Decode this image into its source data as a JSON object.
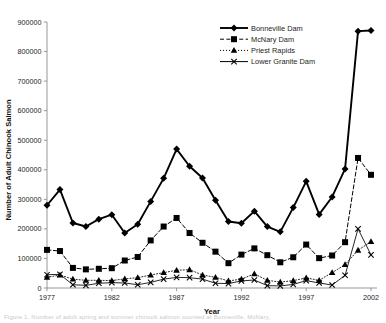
{
  "chart_data": {
    "type": "line",
    "title": "",
    "xlabel": "Year",
    "ylabel": "Number of Adult Chinook Salmon",
    "xlim": [
      1977,
      2002
    ],
    "ylim": [
      0,
      900000
    ],
    "xticks": [
      1977,
      1982,
      1987,
      1992,
      1997,
      2002
    ],
    "yticks": [
      0,
      100000,
      200000,
      300000,
      400000,
      500000,
      600000,
      700000,
      800000,
      900000
    ],
    "ytick_labels": [
      "0",
      "100000",
      "200000",
      "300000",
      "400000",
      "500000",
      "600000",
      "700000",
      "800000",
      "900000"
    ],
    "xtick_labels": [
      "1977",
      "1982",
      "1987",
      "1992",
      "1997",
      "2002"
    ],
    "grid": false,
    "legend_position": "top-right",
    "x": [
      1977,
      1978,
      1979,
      1980,
      1981,
      1982,
      1983,
      1984,
      1985,
      1986,
      1987,
      1988,
      1989,
      1990,
      1991,
      1992,
      1993,
      1994,
      1995,
      1996,
      1997,
      1998,
      1999,
      2000,
      2001,
      2002
    ],
    "series": [
      {
        "name": "Bonneville Dam",
        "marker": "diamond",
        "line": "solid",
        "color": "#000000",
        "values": [
          280000,
          333000,
          220000,
          208000,
          233000,
          248000,
          186000,
          216000,
          293000,
          371000,
          470000,
          412000,
          372000,
          297000,
          225000,
          219000,
          260000,
          208000,
          190000,
          272000,
          361000,
          249000,
          308000,
          403000,
          869000,
          871000
        ]
      },
      {
        "name": "McNary Dam",
        "marker": "square",
        "line": "dashed",
        "color": "#000000",
        "values": [
          129000,
          125000,
          68000,
          63000,
          65000,
          67000,
          93000,
          105000,
          161000,
          208000,
          237000,
          186000,
          153000,
          123000,
          84000,
          113000,
          134000,
          111000,
          87000,
          104000,
          147000,
          101000,
          110000,
          155000,
          440000,
          383000
        ]
      },
      {
        "name": "Priest Rapids",
        "marker": "triangle",
        "line": "dotted",
        "color": "#000000",
        "values": [
          36000,
          44000,
          30000,
          26000,
          26000,
          25000,
          31000,
          35000,
          44000,
          52000,
          60000,
          62000,
          44000,
          36000,
          24000,
          30000,
          48000,
          26000,
          20000,
          25000,
          34000,
          26000,
          52000,
          79000,
          128000,
          157000
        ]
      },
      {
        "name": "Lower Granite Dam",
        "marker": "x",
        "line": "solid",
        "color": "#000000",
        "values": [
          45000,
          46000,
          11000,
          9000,
          16000,
          18000,
          17000,
          11000,
          19000,
          30000,
          36000,
          35000,
          30000,
          16000,
          15000,
          24000,
          27000,
          8000,
          7000,
          12000,
          25000,
          17000,
          10000,
          43000,
          200000,
          112000
        ]
      }
    ]
  },
  "axis": {
    "x_title": "Year",
    "y_title": "Number of Adult Chinook Salmon"
  },
  "legend": {
    "entries": [
      {
        "label": "Bonneville Dam",
        "marker": "diamond",
        "line": "solid"
      },
      {
        "label": "McNary Dam",
        "marker": "square",
        "line": "dashed"
      },
      {
        "label": "Priest Rapids",
        "marker": "triangle",
        "line": "dotted"
      },
      {
        "label": "Lower Granite Dam",
        "marker": "x",
        "line": "solid"
      }
    ]
  },
  "caption": {
    "text": "Figure 1. Number of adult spring and summer chinook salmon counted at Bonneville, McNary,"
  },
  "colors": {
    "ink": "#000000",
    "axis": "#8c8c8c",
    "background": "#ffffff"
  }
}
